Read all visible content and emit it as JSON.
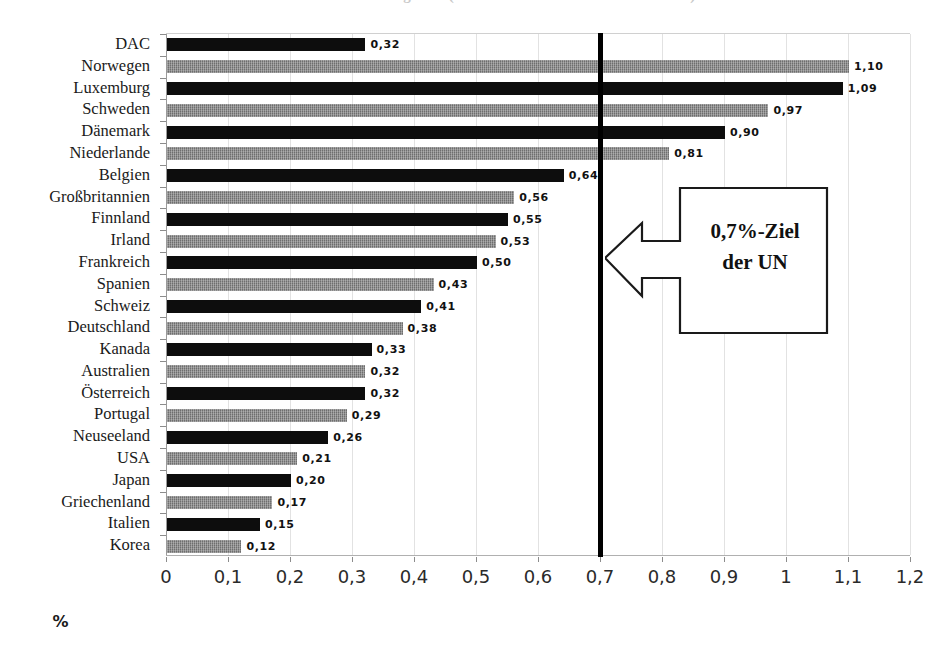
{
  "chart_data": {
    "type": "bar",
    "orientation": "horizontal",
    "title": "",
    "xlabel": "%",
    "ylabel": "",
    "xlim": [
      0,
      1.2
    ],
    "xticks": [
      "0",
      "0,1",
      "0,2",
      "0,3",
      "0,4",
      "0,5",
      "0,6",
      "0,7",
      "0,8",
      "0,9",
      "1",
      "1,1",
      "1,2"
    ],
    "xtick_values": [
      0,
      0.1,
      0.2,
      0.3,
      0.4,
      0.5,
      0.6,
      0.7,
      0.8,
      0.9,
      1.0,
      1.1,
      1.2
    ],
    "grid": "vertical",
    "legend": "none",
    "categories": [
      "DAC",
      "Norwegen",
      "Luxemburg",
      "Schweden",
      "Dänemark",
      "Niederlande",
      "Belgien",
      "Großbritannien",
      "Finnland",
      "Irland",
      "Frankreich",
      "Spanien",
      "Schweiz",
      "Deutschland",
      "Kanada",
      "Australien",
      "Österreich",
      "Portugal",
      "Neuseeland",
      "USA",
      "Japan",
      "Griechenland",
      "Italien",
      "Korea"
    ],
    "values": [
      0.32,
      1.1,
      1.09,
      0.97,
      0.9,
      0.81,
      0.64,
      0.56,
      0.55,
      0.53,
      0.5,
      0.43,
      0.41,
      0.38,
      0.33,
      0.32,
      0.32,
      0.29,
      0.26,
      0.21,
      0.2,
      0.17,
      0.15,
      0.12
    ],
    "value_labels": [
      "0,32",
      "1,10",
      "1,09",
      "0,97",
      "0,90",
      "0,81",
      "0,64",
      "0,56",
      "0,55",
      "0,53",
      "0,50",
      "0,43",
      "0,41",
      "0,38",
      "0,33",
      "0,32",
      "0,32",
      "0,29",
      "0,26",
      "0,21",
      "0,20",
      "0,17",
      "0,15",
      "0,12"
    ],
    "bar_colors": [
      "#0d0d0d",
      "#6e6e6e",
      "#0d0d0d",
      "#6e6e6e",
      "#0d0d0d",
      "#6e6e6e",
      "#0d0d0d",
      "#6e6e6e",
      "#0d0d0d",
      "#6e6e6e",
      "#0d0d0d",
      "#6e6e6e",
      "#0d0d0d",
      "#6e6e6e",
      "#0d0d0d",
      "#6e6e6e",
      "#0d0d0d",
      "#6e6e6e",
      "#0d0d0d",
      "#6e6e6e",
      "#0d0d0d",
      "#6e6e6e",
      "#0d0d0d",
      "#6e6e6e"
    ],
    "annotations": [
      {
        "name": "un-target-line",
        "type": "vline",
        "value": 0.7,
        "color": "#000000"
      },
      {
        "name": "un-target-callout",
        "type": "callout-arrow-left",
        "line1": "0,7%-Ziel",
        "line2": "der UN",
        "points_to": 0.7
      }
    ]
  },
  "callout": {
    "line1": "0,7%-Ziel",
    "line2": "der UN"
  },
  "axis": {
    "x_title": "%"
  },
  "title_strip": {
    "text": "Öffentliche Entwicklungshilfe (Anteil am Bruttonationaleinkommen)"
  }
}
